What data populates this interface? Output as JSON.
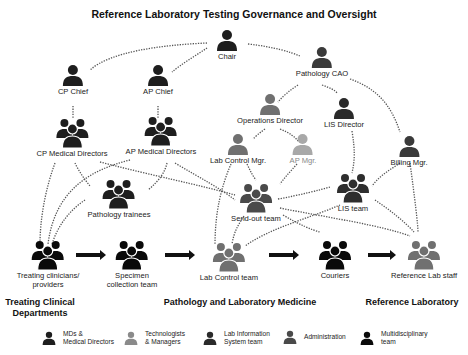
{
  "title": "Reference Laboratory Testing Governance and Oversight",
  "colors": {
    "md": "#1e1e1e",
    "tech": "#707070",
    "tech_light": "#a8a8a8",
    "lis": "#3a3a3a",
    "admin": "#4a4a4a",
    "multi": "#0a0a0a",
    "line": "#555555"
  },
  "nodes": {
    "chair": {
      "label": "Chair",
      "icon": "person-icon",
      "category": "md"
    },
    "pathology_cao": {
      "label": "Pathology CAO",
      "icon": "person-icon",
      "category": "admin"
    },
    "cp_chief": {
      "label": "CP Chief",
      "icon": "person-icon",
      "category": "md"
    },
    "ap_chief": {
      "label": "AP Chief",
      "icon": "person-icon",
      "category": "md"
    },
    "operations_director": {
      "label": "Operations Director",
      "icon": "person-icon",
      "category": "tech"
    },
    "lis_director": {
      "label": "LIS Director",
      "icon": "person-icon",
      "category": "lis"
    },
    "cp_medical_directors": {
      "label": "CP Medical Directors",
      "icon": "group-icon",
      "category": "md"
    },
    "ap_medical_directors": {
      "label": "AP Medical Directors",
      "icon": "group-icon",
      "category": "md"
    },
    "lab_control_mgr": {
      "label": "Lab Control Mgr.",
      "icon": "person-icon",
      "category": "tech"
    },
    "ap_mgr": {
      "label": "AP Mgr.",
      "icon": "person-icon",
      "category": "tech_light"
    },
    "billing_mgr": {
      "label": "Billing Mgr.",
      "icon": "person-icon",
      "category": "admin"
    },
    "pathology_trainees": {
      "label": "Pathology trainees",
      "icon": "group-icon",
      "category": "md"
    },
    "send_out_team": {
      "label": "Send-out team",
      "icon": "group-icon",
      "category": "tech"
    },
    "lis_team": {
      "label": "LIS team",
      "icon": "group-icon",
      "category": "lis"
    },
    "treating_clinicians": {
      "label": "Treating clinicians/\nproviders",
      "icon": "group-icon",
      "category": "multi"
    },
    "specimen_collection": {
      "label": "Specimen\ncollection  team",
      "icon": "group-icon",
      "category": "multi"
    },
    "lab_control_team": {
      "label": "Lab Control team",
      "icon": "group-icon",
      "category": "tech"
    },
    "couriers": {
      "label": "Couriers",
      "icon": "group-icon",
      "category": "multi"
    },
    "reference_lab_staff": {
      "label": "Reference Lab staff",
      "icon": "group-icon",
      "category": "tech"
    }
  },
  "sections": {
    "clinical": "Treating Clinical\nDepartments",
    "pathology": "Pathology and Laboratory Medicine",
    "reference": "Reference Laboratory"
  },
  "legend": [
    {
      "label": "MDs &\nMedical Directors",
      "category": "md"
    },
    {
      "label": "Technologists\n& Managers",
      "category": "tech"
    },
    {
      "label": "Lab Information\nSystem team",
      "category": "lis"
    },
    {
      "label": "Administration",
      "category": "admin"
    },
    {
      "label": "Multidisciplinary\nteam",
      "category": "multi"
    }
  ],
  "workflow_arrows": [
    {
      "from": "treating_clinicians",
      "to": "specimen_collection"
    },
    {
      "from": "specimen_collection",
      "to": "lab_control_team"
    },
    {
      "from": "lab_control_team",
      "to": "couriers"
    },
    {
      "from": "couriers",
      "to": "reference_lab_staff"
    }
  ]
}
